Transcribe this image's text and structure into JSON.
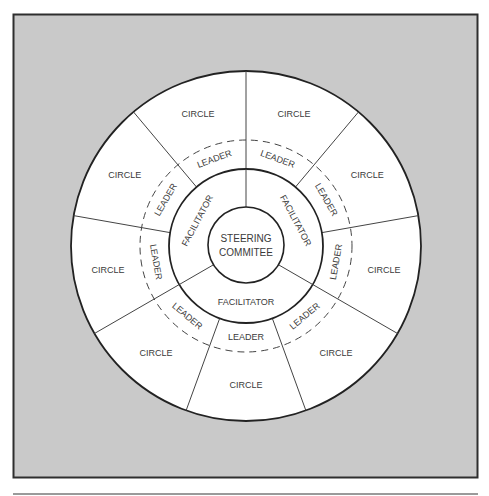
{
  "diagram": {
    "type": "concentric-organization-chart",
    "frame": {
      "background": "#c8c8c8",
      "border": "#333333"
    },
    "center": {
      "label_line1": "STEERING",
      "label_line2": "COMMITEE"
    },
    "facilitator_ring": {
      "segments": [
        {
          "label": "FACILITATOR",
          "position": "upper-left"
        },
        {
          "label": "FACILITATOR",
          "position": "upper-right"
        },
        {
          "label": "FACILITATOR",
          "position": "bottom"
        }
      ]
    },
    "leader_ring": {
      "style": "dashed-outer-boundary",
      "segments": [
        {
          "label": "LEADER"
        },
        {
          "label": "LEADER"
        },
        {
          "label": "LEADER"
        },
        {
          "label": "LEADER"
        },
        {
          "label": "LEADER"
        },
        {
          "label": "LEADER"
        },
        {
          "label": "LEADER"
        },
        {
          "label": "LEADER"
        },
        {
          "label": "LEADER"
        }
      ]
    },
    "circle_ring": {
      "segments": [
        {
          "label": "CIRCLE"
        },
        {
          "label": "CIRCLE"
        },
        {
          "label": "CIRCLE"
        },
        {
          "label": "CIRCLE"
        },
        {
          "label": "CIRCLE"
        },
        {
          "label": "CIRCLE"
        },
        {
          "label": "CIRCLE"
        },
        {
          "label": "CIRCLE"
        },
        {
          "label": "CIRCLE"
        }
      ]
    }
  }
}
